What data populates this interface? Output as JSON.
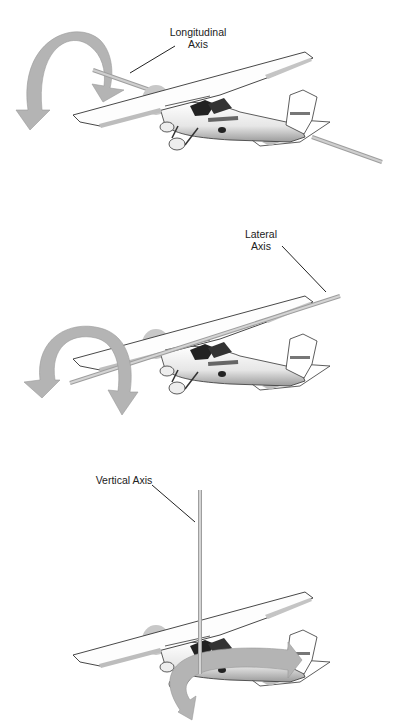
{
  "diagram": {
    "type": "aircraft-axes-illustration",
    "panels": [
      {
        "id": "roll",
        "label_line1": "Longitudinal",
        "label_line2": "Axis",
        "motion": "roll",
        "arrow_color": "#b4b4b4",
        "axis_color": "#a8a8a8"
      },
      {
        "id": "pitch",
        "label_line1": "Lateral",
        "label_line2": "Axis",
        "motion": "pitch",
        "arrow_color": "#b4b4b4",
        "axis_color": "#a8a8a8"
      },
      {
        "id": "yaw",
        "label_line1": "Vertical Axis",
        "motion": "yaw",
        "arrow_color": "#b4b4b4",
        "axis_color": "#a8a8a8"
      }
    ]
  }
}
